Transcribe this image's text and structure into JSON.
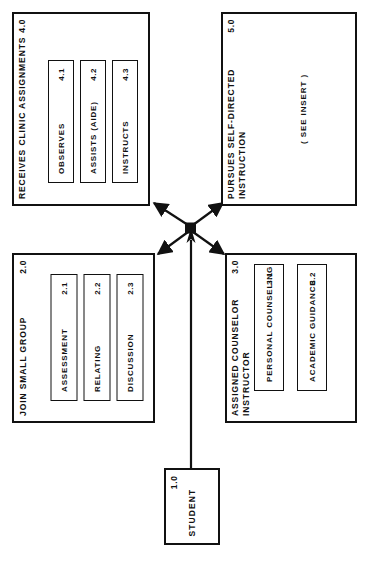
{
  "diagram": {
    "orientation": "rotated-90-ccw",
    "line_color": "#111111",
    "background_color": "#ffffff",
    "junction": {
      "name": "fan-out-junction",
      "x": 190,
      "y": 228
    },
    "nodes": [
      {
        "key": "receives_clinic_assignments",
        "title": "RECEIVES CLINIC ASSIGNMENTS",
        "id": "4.0",
        "note": "",
        "subtasks": [
          {
            "label": "OBSERVES",
            "id": "4.1"
          },
          {
            "label": "ASSISTS (AIDE)",
            "id": "4.2"
          },
          {
            "label": "INSTRUCTS",
            "id": "4.3"
          }
        ]
      },
      {
        "key": "pursues_self_directed_instruction",
        "title": "PURSUES SELF-DIRECTED\nINSTRUCTION",
        "id": "5.0",
        "note": "( SEE INSERT )",
        "subtasks": []
      },
      {
        "key": "join_small_group",
        "title": "JOIN SMALL GROUP",
        "id": "2.0",
        "note": "",
        "subtasks": [
          {
            "label": "ASSESSMENT",
            "id": "2.1"
          },
          {
            "label": "RELATING",
            "id": "2.2"
          },
          {
            "label": "DISCUSSION",
            "id": "2.3"
          }
        ]
      },
      {
        "key": "assigned_counselor_instructor",
        "title": "ASSIGNED COUNSELOR\nINSTRUCTOR",
        "id": "3.0",
        "note": "",
        "subtasks": [
          {
            "label": "PERSONAL COUNSELING",
            "id": "3.1"
          },
          {
            "label": "ACADEMIC GUIDANCE",
            "id": "3.2"
          }
        ]
      },
      {
        "key": "student",
        "title": "STUDENT",
        "id": "1.0",
        "note": "",
        "subtasks": []
      }
    ]
  }
}
